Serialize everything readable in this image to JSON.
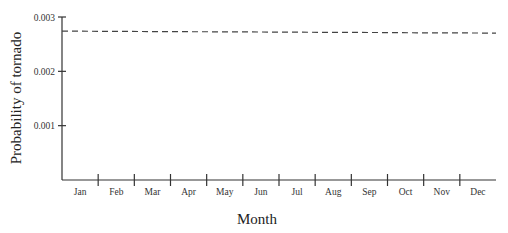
{
  "chart_data": {
    "type": "line",
    "title": "",
    "xlabel": "Month",
    "ylabel": "Probability of tornado",
    "categories": [
      "Jan",
      "Feb",
      "Mar",
      "Apr",
      "May",
      "Jun",
      "Jul",
      "Aug",
      "Sep",
      "Oct",
      "Nov",
      "Dec"
    ],
    "series": [
      {
        "name": "Probability of tornado",
        "style": "dashed",
        "values": [
          0.00274,
          0.002737,
          0.002733,
          0.00273,
          0.002727,
          0.002724,
          0.00272,
          0.002717,
          0.002714,
          0.00271,
          0.002707,
          0.002704
        ]
      }
    ],
    "yticks": [
      0.001,
      0.002,
      0.003
    ],
    "ytick_labels": [
      "0.001",
      "0.002",
      "0.003"
    ],
    "ylim": [
      0,
      0.003
    ],
    "grid": false,
    "legend": null
  },
  "colors": {
    "axis": "#333333",
    "line": "#444444",
    "text": "#222222"
  }
}
